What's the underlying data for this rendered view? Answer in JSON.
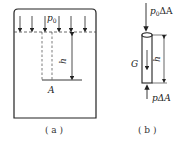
{
  "panel_a": {
    "caption": "( a )",
    "surface_pressure_label": "p",
    "surface_pressure_sub": "0",
    "depth_label": "h",
    "area_label": "A",
    "surface_arrows": 6
  },
  "panel_b": {
    "caption": "( b )",
    "top_force_label": "p",
    "top_force_sub": "0",
    "top_force_suffix": "ΔA",
    "weight_label": "G",
    "height_label": "h",
    "bottom_force_label": "pΔA"
  },
  "colors": {
    "line": "#222222",
    "dashed": "#444444"
  }
}
